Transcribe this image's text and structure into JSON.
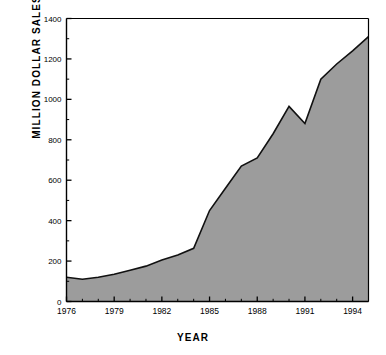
{
  "chart_data": {
    "type": "area",
    "title": "",
    "xlabel": "YEAR",
    "ylabel": "MILLION DOLLAR SALES",
    "xlim": [
      1976,
      1995
    ],
    "ylim": [
      0,
      1400
    ],
    "grid": false,
    "legend": null,
    "x_major_ticks": [
      1976,
      1979,
      1982,
      1985,
      1988,
      1991,
      1994
    ],
    "x_minor_tick_step": 1,
    "y_major_ticks": [
      0,
      200,
      400,
      600,
      800,
      1000,
      1200,
      1400
    ],
    "y_minor_tick_step": 100,
    "x_tick_labels": [
      "1976",
      "1979",
      "1982",
      "1985",
      "1988",
      "1991",
      "1994"
    ],
    "y_tick_labels": [
      "0",
      "200",
      "400",
      "600",
      "800",
      "1000",
      "1200",
      "1400"
    ],
    "series": [
      {
        "name": "Million Dollar Sales",
        "fill_color": "#9c9c9c",
        "line_color": "#111111",
        "x": [
          1976,
          1977,
          1978,
          1979,
          1980,
          1981,
          1982,
          1983,
          1984,
          1985,
          1986,
          1987,
          1988,
          1989,
          1990,
          1991,
          1992,
          1993,
          1994,
          1995
        ],
        "values": [
          120,
          110,
          120,
          135,
          155,
          175,
          205,
          230,
          263,
          450,
          560,
          670,
          710,
          830,
          965,
          880,
          1100,
          1175,
          1240,
          1310
        ]
      }
    ]
  },
  "axes": {
    "x_axis_name": "YEAR",
    "y_axis_name": "MILLION DOLLAR SALES"
  }
}
